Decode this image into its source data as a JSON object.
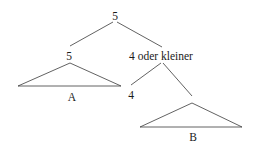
{
  "diagram": {
    "type": "tree",
    "nodes": {
      "root": {
        "label": "5"
      },
      "left_child": {
        "label": "5"
      },
      "right_child": {
        "label": "4 oder kleiner"
      },
      "inner_leaf": {
        "label": "4"
      }
    },
    "subtrees": {
      "a": {
        "label": "A"
      },
      "b": {
        "label": "B"
      }
    },
    "colors": {
      "line": "#3a3a3a",
      "text": "#1a1a1a",
      "background": "#ffffff"
    }
  }
}
